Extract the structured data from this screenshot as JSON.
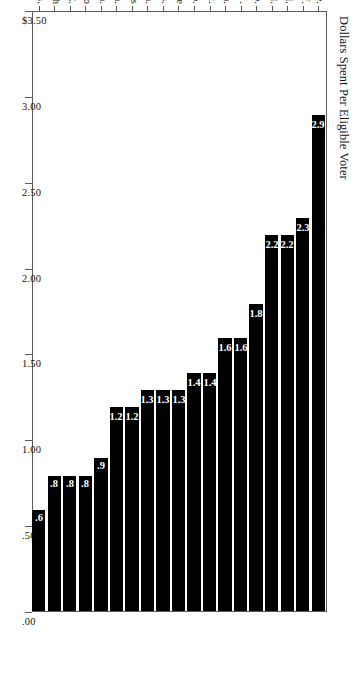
{
  "chart_data": {
    "type": "bar",
    "orientation": "horizontal",
    "title": "",
    "xlabel": "Dollars Spent Per Eligible Voter",
    "ylabel": "",
    "xlim": [
      0.0,
      3.5
    ],
    "grid": false,
    "legend": "none",
    "axis_tick_labels": [
      "$3.50",
      "3.00",
      "2.50",
      "2.00",
      "1.50",
      "1.00",
      ".50",
      ".00"
    ],
    "axis_tick_values": [
      3.5,
      3.0,
      2.5,
      2.0,
      1.5,
      1.0,
      0.5,
      0.0
    ],
    "categories": [
      "Ore.",
      "Calif.",
      "Del.",
      "Ill.",
      "Wyo.",
      "N.J.",
      "Kan.",
      "Mont.",
      "Mo.",
      "Maine",
      "Wis.",
      "Pa.",
      "Texas",
      "Wash.",
      "Minn.",
      "Idaho",
      "N.C.",
      "Utah",
      "Miss."
    ],
    "values": [
      2.9,
      2.3,
      2.2,
      2.2,
      1.8,
      1.6,
      1.6,
      1.4,
      1.4,
      1.3,
      1.3,
      1.3,
      1.2,
      1.2,
      0.9,
      0.8,
      0.8,
      0.8,
      0.6
    ],
    "value_labels": [
      "2.9",
      "2.3",
      "2.2",
      "2.2",
      "1.8",
      "1.6",
      "1.6",
      "1.4",
      "1.4",
      "1.3",
      "1.3",
      "1.3",
      "1.2",
      "1.2",
      ".9",
      ".8",
      ".8",
      ".8",
      ".6"
    ],
    "bar_color": "#000000",
    "value_label_color": "#ffffff",
    "frame_color": "#5a5a5a"
  }
}
